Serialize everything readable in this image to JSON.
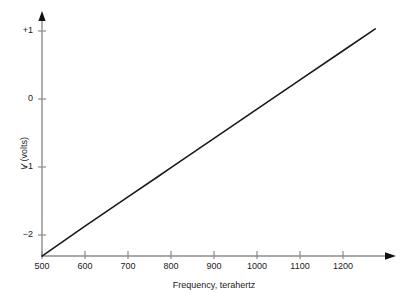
{
  "chart_data": {
    "type": "line",
    "title": "",
    "xlabel": "Frequency, terahertz",
    "ylabel": "V (volts)",
    "ylabel_italic_part": "V",
    "ylabel_rest": " (volts)",
    "xlim": [
      500,
      1300
    ],
    "ylim": [
      -2.35,
      1.05
    ],
    "xticks": [
      500,
      600,
      700,
      800,
      900,
      1000,
      1100,
      1200
    ],
    "xtick_labels": [
      "500",
      "600",
      "700",
      "800",
      "900",
      "1000",
      "1100",
      "1200"
    ],
    "yticks": [
      1,
      0,
      -1,
      -2
    ],
    "ytick_labels": [
      "+1",
      "0",
      "−1",
      "−2"
    ],
    "grid": false,
    "legend": false,
    "axis_arrows": true,
    "series": [
      {
        "name": "stopping voltage",
        "color": "#1a1a1a",
        "x": [
          500,
          600,
          700,
          770,
          800,
          900,
          1000,
          1100,
          1200,
          1275
        ],
        "y": [
          -2.31,
          -1.87,
          -1.44,
          -1.14,
          -1.01,
          -0.58,
          -0.15,
          0.28,
          0.71,
          1.03
        ]
      }
    ]
  },
  "axes": {
    "y_arrow_name": "y-axis-arrowhead",
    "x_arrow_name": "x-axis-arrowhead"
  }
}
